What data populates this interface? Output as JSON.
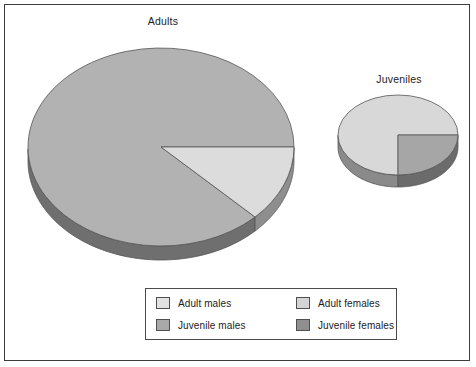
{
  "chart_data": [
    {
      "type": "pie",
      "title": "Adults",
      "categories": [
        "Adult females",
        "Adult males"
      ],
      "values": [
        87.5,
        12.5
      ],
      "colors": [
        "#b2b2b2",
        "#dcdcdc"
      ],
      "start_angle_deg": 0,
      "direction": "counterclockwise",
      "three_d": true,
      "relative_size": "large",
      "center_px": [
        161,
        147
      ],
      "radius_x_px": 133,
      "radius_y_px": 99,
      "depth_px": 14
    },
    {
      "type": "pie",
      "title": "Juveniles",
      "categories": [
        "Juvenile males",
        "Juvenile females"
      ],
      "values": [
        75,
        25
      ],
      "colors": [
        "#d8d8d8",
        "#a6a6a6"
      ],
      "start_angle_deg": 0,
      "direction": "counterclockwise",
      "three_d": true,
      "relative_size": "small",
      "center_px": [
        398,
        135
      ],
      "radius_x_px": 60,
      "radius_y_px": 40,
      "depth_px": 12
    }
  ],
  "titles": {
    "adults": "Adults",
    "juveniles": "Juveniles"
  },
  "legend": {
    "position": "bottom-center",
    "items": [
      {
        "label": "Adult males",
        "color": "#e2e2e2"
      },
      {
        "label": "Adult females",
        "color": "#d4d4d4"
      },
      {
        "label": "Juvenile males",
        "color": "#a9a9a9"
      },
      {
        "label": "Juvenile females",
        "color": "#8f8f8f"
      }
    ]
  },
  "colors": {
    "background": "#ffffff",
    "frame_border": "#3d3d3d",
    "slice_outline": "#555555",
    "text": "#1c1c1c",
    "adults_major_top": "#b2b2b2",
    "adults_major_side": "#6f6f6f",
    "adults_minor_top": "#dcdcdc",
    "adults_minor_side": "#8e8e8e",
    "juveniles_major_top": "#d8d8d8",
    "juveniles_major_side": "#8a8a8a",
    "juveniles_minor_top": "#a6a6a6",
    "juveniles_minor_side": "#6b6b6b"
  }
}
